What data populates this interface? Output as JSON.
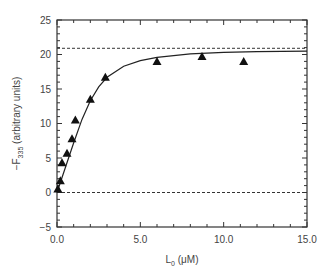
{
  "chart_data": {
    "type": "scatter",
    "title": "",
    "xlabel": "L0 (μM)",
    "xlabel_main": "L",
    "xlabel_sub": "0",
    "xlabel_unit": " (μM)",
    "ylabel": "−F335 (arbitrary units)",
    "ylabel_main": "−F",
    "ylabel_sub": "335",
    "ylabel_unit": " (arbitrary units)",
    "xlim": [
      0,
      15
    ],
    "ylim": [
      -5,
      25
    ],
    "x_ticks": [
      "0.0",
      "5.0",
      "10.0",
      "15.0"
    ],
    "y_ticks": [
      "−5",
      "0",
      "5",
      "10",
      "15",
      "20",
      "25"
    ],
    "grid": false,
    "legend": "none",
    "series": [
      {
        "name": "data",
        "marker": "triangle",
        "x": [
          0.05,
          0.2,
          0.3,
          0.6,
          0.9,
          1.1,
          2.0,
          2.9,
          6.0,
          8.7,
          11.2
        ],
        "y": [
          0.5,
          1.7,
          4.3,
          5.7,
          7.8,
          10.5,
          13.5,
          16.7,
          19.0,
          19.7,
          19.0
        ]
      },
      {
        "name": "fit",
        "style": "solid-line",
        "x": [
          0,
          0.5,
          1,
          1.5,
          2,
          2.5,
          3,
          4,
          5,
          6,
          8,
          10,
          12,
          15
        ],
        "y": [
          0,
          3.6,
          7.2,
          10.6,
          13.3,
          15.3,
          16.7,
          18.3,
          19.1,
          19.6,
          20.1,
          20.3,
          20.4,
          20.5
        ]
      }
    ],
    "reference_lines": [
      {
        "y": 20.9,
        "style": "dashed"
      },
      {
        "y": 0,
        "style": "dashed"
      }
    ]
  }
}
